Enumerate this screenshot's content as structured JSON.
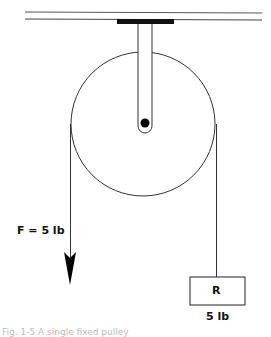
{
  "diagram": {
    "type": "single fixed pulley",
    "force_label": "F = 5 lb",
    "load_label": "R",
    "load_weight": "5 lb",
    "caption": "Fig. 1-5  A single fixed pulley"
  }
}
